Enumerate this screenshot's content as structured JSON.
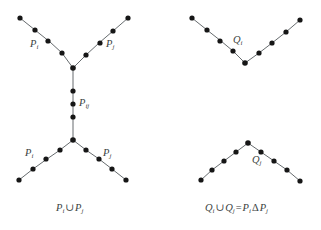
{
  "figure": {
    "width": 321,
    "height": 230,
    "background_color": "#ffffff",
    "node_color": "#161616",
    "edge_color": "#555a5e",
    "label_color": "#3b3f42"
  },
  "labels": {
    "top_left_pi": {
      "base": "P",
      "sub": "i"
    },
    "top_left_pj": {
      "base": "P",
      "sub": "j"
    },
    "middle_pij": {
      "base": "P",
      "sub": "ij"
    },
    "bottom_left_pi": {
      "base": "P",
      "sub": "i"
    },
    "bottom_left_pj": {
      "base": "P",
      "sub": "j"
    },
    "top_right_qi": {
      "base": "Q",
      "sub": "i"
    },
    "bottom_right_qj": {
      "base": "Q",
      "sub": "j"
    }
  },
  "captions": {
    "left": {
      "text": "P i ∪ P j",
      "parts": [
        {
          "base": "P",
          "sub": "i"
        },
        {
          "op": "∪"
        },
        {
          "base": "P",
          "sub": "j"
        }
      ]
    },
    "right": {
      "text": "Q i ∪ Q j = P i Δ P j",
      "parts": [
        {
          "base": "Q",
          "sub": "i"
        },
        {
          "op": "∪"
        },
        {
          "base": "Q",
          "sub": "j"
        },
        {
          "op": "="
        },
        {
          "base": "P",
          "sub": "i"
        },
        {
          "op": "Δ"
        },
        {
          "base": "P",
          "sub": "j"
        }
      ]
    }
  },
  "graph": {
    "edges": [
      {
        "name": "left-top-left-arm",
        "points": "20,18 35,30 50,42 62,53 73,68"
      },
      {
        "name": "left-top-right-arm",
        "points": "73,68 86,55 99,43 113,31 128,18"
      },
      {
        "name": "left-middle-stem",
        "points": "73,68 73,140"
      },
      {
        "name": "left-bottom-left-arm",
        "points": "73,140 60,150 47,159 33,169 19,180"
      },
      {
        "name": "left-bottom-right-arm",
        "points": "73,140 86,150 99,159 112,169 126,180"
      },
      {
        "name": "right-top-left-arm",
        "points": "192,18 207,30 221,41 233,51 245,63"
      },
      {
        "name": "right-top-right-arm",
        "points": "245,63 259,53 272,43 286,32 300,20"
      },
      {
        "name": "right-bottom-left-arm",
        "points": "248,143 236,152 224,161 212,170 201,180"
      },
      {
        "name": "right-bottom-right-arm",
        "points": "248,143 261,152 274,161 287,170 300,181"
      }
    ],
    "nodes": [
      {
        "name": "n-tl-1",
        "cx": 20,
        "cy": 18,
        "r": 2.6
      },
      {
        "name": "n-tl-2",
        "cx": 35,
        "cy": 30,
        "r": 2.6
      },
      {
        "name": "n-tl-3",
        "cx": 48,
        "cy": 41,
        "r": 2.6
      },
      {
        "name": "n-tl-4",
        "cx": 62,
        "cy": 53,
        "r": 2.6
      },
      {
        "name": "n-tl-junction",
        "cx": 73,
        "cy": 68,
        "r": 2.8
      },
      {
        "name": "n-tr-1",
        "cx": 86,
        "cy": 55,
        "r": 2.6
      },
      {
        "name": "n-tr-2",
        "cx": 100,
        "cy": 43,
        "r": 2.6
      },
      {
        "name": "n-tr-3",
        "cx": 113,
        "cy": 31,
        "r": 2.6
      },
      {
        "name": "n-tr-4",
        "cx": 128,
        "cy": 18,
        "r": 2.6
      },
      {
        "name": "n-stem-1",
        "cx": 73,
        "cy": 91,
        "r": 2.6
      },
      {
        "name": "n-stem-2",
        "cx": 73,
        "cy": 104,
        "r": 2.6
      },
      {
        "name": "n-stem-3",
        "cx": 73,
        "cy": 117,
        "r": 2.6
      },
      {
        "name": "n-bl-junction",
        "cx": 73,
        "cy": 140,
        "r": 2.8
      },
      {
        "name": "n-bl-1",
        "cx": 60,
        "cy": 150,
        "r": 2.6
      },
      {
        "name": "n-bl-2",
        "cx": 46,
        "cy": 159,
        "r": 2.6
      },
      {
        "name": "n-bl-3",
        "cx": 33,
        "cy": 169,
        "r": 2.6
      },
      {
        "name": "n-bl-4",
        "cx": 19,
        "cy": 180,
        "r": 2.6
      },
      {
        "name": "n-br-1",
        "cx": 86,
        "cy": 150,
        "r": 2.6
      },
      {
        "name": "n-br-2",
        "cx": 99,
        "cy": 159,
        "r": 2.6
      },
      {
        "name": "n-br-3",
        "cx": 112,
        "cy": 169,
        "r": 2.6
      },
      {
        "name": "n-br-4",
        "cx": 126,
        "cy": 180,
        "r": 2.6
      },
      {
        "name": "n-rtl-1",
        "cx": 192,
        "cy": 18,
        "r": 2.6
      },
      {
        "name": "n-rtl-2",
        "cx": 207,
        "cy": 30,
        "r": 2.6
      },
      {
        "name": "n-rtl-3",
        "cx": 220,
        "cy": 41,
        "r": 2.6
      },
      {
        "name": "n-rtl-4",
        "cx": 233,
        "cy": 51,
        "r": 2.6
      },
      {
        "name": "n-rt-apex",
        "cx": 245,
        "cy": 63,
        "r": 2.8
      },
      {
        "name": "n-rtr-1",
        "cx": 259,
        "cy": 53,
        "r": 2.6
      },
      {
        "name": "n-rtr-2",
        "cx": 272,
        "cy": 43,
        "r": 2.6
      },
      {
        "name": "n-rtr-3",
        "cx": 286,
        "cy": 32,
        "r": 2.6
      },
      {
        "name": "n-rtr-4",
        "cx": 300,
        "cy": 20,
        "r": 2.6
      },
      {
        "name": "n-rb-apex",
        "cx": 248,
        "cy": 143,
        "r": 2.8
      },
      {
        "name": "n-rbl-1",
        "cx": 236,
        "cy": 152,
        "r": 2.6
      },
      {
        "name": "n-rbl-2",
        "cx": 224,
        "cy": 161,
        "r": 2.6
      },
      {
        "name": "n-rbl-3",
        "cx": 212,
        "cy": 170,
        "r": 2.6
      },
      {
        "name": "n-rbl-4",
        "cx": 201,
        "cy": 180,
        "r": 2.6
      },
      {
        "name": "n-rbr-1",
        "cx": 261,
        "cy": 152,
        "r": 2.6
      },
      {
        "name": "n-rbr-2",
        "cx": 274,
        "cy": 161,
        "r": 2.6
      },
      {
        "name": "n-rbr-3",
        "cx": 287,
        "cy": 170,
        "r": 2.6
      },
      {
        "name": "n-rbr-4",
        "cx": 300,
        "cy": 181,
        "r": 2.6
      }
    ]
  }
}
